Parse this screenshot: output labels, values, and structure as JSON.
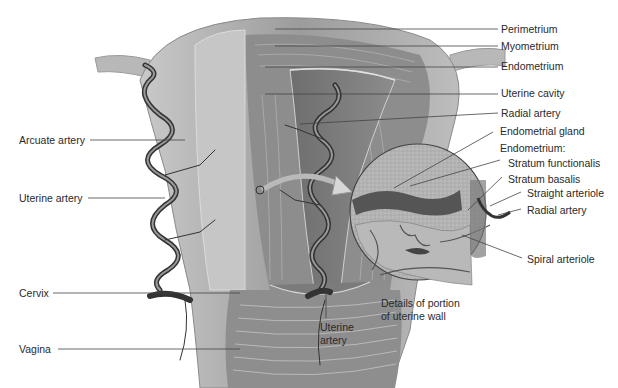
{
  "diagram": {
    "colors": {
      "background": "#ffffff",
      "tissue_light": "#b5b5b5",
      "tissue_mid": "#8a8a8a",
      "tissue_dark": "#5e5e5e",
      "artery": "#3a3a3a",
      "leader_line": "#444444",
      "label_text": "#2a2a2a"
    },
    "labels_right": {
      "perimetrium": "Perimetrium",
      "myometrium": "Myometrium",
      "endometrium": "Endometrium",
      "uterine_cavity": "Uterine cavity",
      "radial_artery": "Radial artery"
    },
    "labels_left": {
      "arcuate_artery": "Arcuate artery",
      "uterine_artery": "Uterine artery",
      "cervix": "Cervix",
      "vagina": "Vagina"
    },
    "labels_bottom": {
      "uterine_artery_line1": "Uterine",
      "uterine_artery_line2": "artery"
    },
    "detail_inset": {
      "caption_line1": "Details of portion",
      "caption_line2": "of uterine wall",
      "labels": {
        "endometrial_gland": "Endometrial gland",
        "endometrium_heading": "Endometrium:",
        "stratum_functionalis": "Stratum functionalis",
        "stratum_basalis": "Stratum basalis",
        "straight_arteriole": "Straight arteriole",
        "radial_artery": "Radial artery",
        "spiral_arteriole": "Spiral arteriole"
      }
    }
  }
}
